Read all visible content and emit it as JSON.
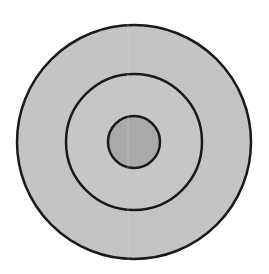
{
  "diagram": {
    "type": "concentric-circles",
    "background": "#ffffff",
    "stroke_color": "#1a1a1a",
    "center": [
      134,
      142
    ],
    "rings": [
      {
        "name": "outer",
        "radius": 117,
        "fill": "#c4c4c4"
      },
      {
        "name": "middle",
        "radius": 68,
        "fill": "#c6c6c6"
      },
      {
        "name": "inner",
        "radius": 26,
        "fill": "#a9a9a9"
      }
    ]
  }
}
